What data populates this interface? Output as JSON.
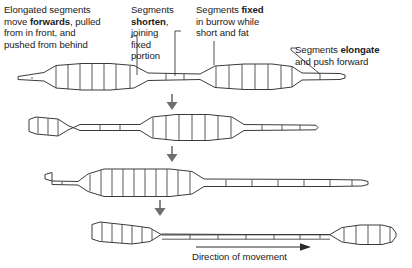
{
  "diagram": {
    "stage_count": 4,
    "line_color": "#3b3b3b",
    "arrow_color": "#6e6e6e",
    "text_color": "#1a1a1a",
    "background": "#ffffff"
  },
  "annotations": {
    "elongated_segments": {
      "text": "Elongated segments move forwards, pulled from in front, and pushed from behind",
      "parts": [
        {
          "t": "Elongated segments\nmove ",
          "bold": false
        },
        {
          "t": "forwards",
          "bold": true
        },
        {
          "t": ", pulled\nfrom in front, and\npushed from behind",
          "bold": false
        }
      ]
    },
    "segments_shorten": {
      "text": "Segments shorten, joining fixed portion",
      "parts": [
        {
          "t": "Segments\n",
          "bold": false
        },
        {
          "t": "shorten",
          "bold": true
        },
        {
          "t": ",\njoining\nfixed\nportion",
          "bold": false
        }
      ]
    },
    "segments_fixed": {
      "text": "Segments fixed in burrow while short and fat",
      "parts": [
        {
          "t": "Segments ",
          "bold": false
        },
        {
          "t": "fixed",
          "bold": true
        },
        {
          "t": "\nin burrow while\nshort and fat",
          "bold": false
        }
      ]
    },
    "segments_elongate": {
      "text": "Segments elongate and push forward",
      "parts": [
        {
          "t": "Segments ",
          "bold": false
        },
        {
          "t": "elongate",
          "bold": true
        },
        {
          "t": "\nand push forward",
          "bold": false
        }
      ]
    },
    "direction_of_movement": {
      "text": "Direction of movement"
    }
  },
  "stages": [
    {
      "name": "stage-1",
      "row": 1,
      "description": "Front thin tail at left, first thick contracted bulge, thin middle, second thick contracted bulge, thin elongated head at right",
      "bulge_segment_counts": [
        6,
        6
      ]
    },
    {
      "name": "stage-2",
      "row": 2,
      "description": "Bulges have moved backwards relative to the body; left bulge is short, right bulge is long with many segments",
      "bulge_segment_counts": [
        4,
        7
      ]
    },
    {
      "name": "stage-3",
      "row": 3,
      "description": "Single large central bulge with long thin elongated region extending to the right",
      "bulge_segment_counts": [
        11
      ]
    },
    {
      "name": "stage-4",
      "row": 4,
      "description": "Left bulge plus a new small bulge forming at the far right head end",
      "bulge_segment_counts": [
        7,
        4
      ]
    }
  ],
  "flow_arrows": [
    {
      "name": "stage-transition-arrow-1",
      "between": "stage-1 to stage-2"
    },
    {
      "name": "stage-transition-arrow-2",
      "between": "stage-2 to stage-3"
    },
    {
      "name": "stage-transition-arrow-3",
      "between": "stage-3 to stage-4"
    }
  ],
  "leaders": [
    {
      "name": "leader-elongated-segments",
      "from": "elongated_segments",
      "to": "stage-1 thin middle region"
    },
    {
      "name": "leader-segments-shorten",
      "from": "segments_shorten",
      "to": "stage-1 thin middle region"
    },
    {
      "name": "leader-segments-fixed",
      "from": "segments_fixed",
      "to": "stage-1 right bulge"
    },
    {
      "name": "leader-segments-elongate",
      "from": "segments_elongate",
      "to": "stage-1 right tail tip"
    }
  ]
}
